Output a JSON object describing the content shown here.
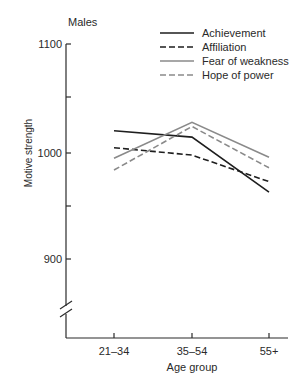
{
  "chart_data": {
    "type": "line",
    "title": "Males",
    "xlabel": "Age group",
    "ylabel": "Motive strength",
    "categories": [
      "21–34",
      "35–54",
      "55+"
    ],
    "ylim": [
      850,
      1100
    ],
    "yticks": [
      900,
      950,
      1000,
      1050,
      1100
    ],
    "ytick_labels": [
      "900",
      "",
      "1000",
      "",
      "1100"
    ],
    "axis_break": true,
    "grid": false,
    "legend_position": "top-right",
    "series": [
      {
        "name": "Achievement",
        "style": "solid",
        "color": "#1e1e1e",
        "values": [
          1021,
          1015,
          963
        ]
      },
      {
        "name": "Affiliation",
        "style": "dashed",
        "color": "#1e1e1e",
        "values": [
          1005,
          998,
          973
        ]
      },
      {
        "name": "Fear of weakness",
        "style": "solid",
        "color": "#8a8a8a",
        "values": [
          995,
          1029,
          996
        ]
      },
      {
        "name": "Hope of power",
        "style": "dashed",
        "color": "#8a8a8a",
        "values": [
          984,
          1025,
          986
        ]
      }
    ]
  }
}
